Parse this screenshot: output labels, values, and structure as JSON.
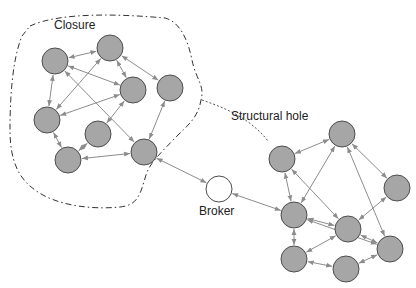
{
  "labels": {
    "closure": "Closure",
    "structural_hole": "Structural hole",
    "broker": "Broker"
  },
  "colors": {
    "node_fill": "#a6a6a6",
    "node_stroke": "#4d4d4d",
    "broker_fill": "#ffffff",
    "edge": "#8c8c8c",
    "boundary": "#333333",
    "hole_line": "#555555"
  },
  "nodes": [
    {
      "id": "A",
      "x": 55,
      "y": 61,
      "r": 13,
      "group": "closure"
    },
    {
      "id": "B",
      "x": 110,
      "y": 48,
      "r": 13,
      "group": "closure"
    },
    {
      "id": "C",
      "x": 133,
      "y": 90,
      "r": 13,
      "group": "closure"
    },
    {
      "id": "D",
      "x": 170,
      "y": 88,
      "r": 13,
      "group": "closure"
    },
    {
      "id": "E",
      "x": 47,
      "y": 120,
      "r": 13,
      "group": "closure"
    },
    {
      "id": "F",
      "x": 98,
      "y": 134,
      "r": 13,
      "group": "closure"
    },
    {
      "id": "G",
      "x": 68,
      "y": 160,
      "r": 13,
      "group": "closure"
    },
    {
      "id": "H",
      "x": 144,
      "y": 152,
      "r": 13,
      "group": "closure"
    },
    {
      "id": "Broker",
      "x": 219,
      "y": 189,
      "r": 13,
      "group": "broker"
    },
    {
      "id": "I",
      "x": 282,
      "y": 159,
      "r": 13,
      "group": "right"
    },
    {
      "id": "J",
      "x": 342,
      "y": 134,
      "r": 13,
      "group": "right"
    },
    {
      "id": "K",
      "x": 397,
      "y": 188,
      "r": 13,
      "group": "right"
    },
    {
      "id": "L",
      "x": 294,
      "y": 215,
      "r": 13,
      "group": "right"
    },
    {
      "id": "M",
      "x": 348,
      "y": 229,
      "r": 13,
      "group": "right"
    },
    {
      "id": "N",
      "x": 390,
      "y": 249,
      "r": 13,
      "group": "right"
    },
    {
      "id": "O",
      "x": 294,
      "y": 259,
      "r": 13,
      "group": "right"
    },
    {
      "id": "P",
      "x": 346,
      "y": 269,
      "r": 13,
      "group": "right"
    }
  ],
  "edges": [
    [
      "A",
      "B"
    ],
    [
      "A",
      "C"
    ],
    [
      "A",
      "E"
    ],
    [
      "A",
      "H"
    ],
    [
      "B",
      "E"
    ],
    [
      "B",
      "C"
    ],
    [
      "B",
      "D"
    ],
    [
      "C",
      "E"
    ],
    [
      "C",
      "F"
    ],
    [
      "D",
      "H"
    ],
    [
      "E",
      "G"
    ],
    [
      "F",
      "G"
    ],
    [
      "G",
      "H"
    ],
    [
      "H",
      "Broker"
    ],
    [
      "Broker",
      "L"
    ],
    [
      "I",
      "J"
    ],
    [
      "I",
      "L"
    ],
    [
      "I",
      "M"
    ],
    [
      "J",
      "L"
    ],
    [
      "J",
      "K"
    ],
    [
      "J",
      "N"
    ],
    [
      "K",
      "M"
    ],
    [
      "L",
      "M"
    ],
    [
      "L",
      "O"
    ],
    [
      "M",
      "O"
    ],
    [
      "M",
      "N"
    ],
    [
      "O",
      "P"
    ],
    [
      "P",
      "N"
    ],
    [
      "L",
      "N"
    ]
  ],
  "closure_boundary": "M 30 26 C 60 12, 120 14, 165 18 C 180 22, 188 40, 192 60 C 196 80, 205 85, 201 100 C 198 118, 188 125, 175 138 C 162 152, 150 162, 146 175 C 140 195, 138 205, 120 207 C 90 210, 55 205, 35 190 C 18 178, 10 160, 10 130 C 10 100, 12 60, 22 36 Z",
  "structural_hole_line": "M 202 100 C 225 108, 250 118, 268 141"
}
